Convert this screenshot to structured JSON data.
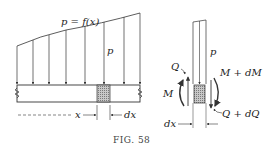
{
  "figure": {
    "caption": "FIG. 58",
    "beam_diagram": {
      "load_label": "p = f(x)",
      "load_arrow_label": "p",
      "position_label": "x",
      "element_width_label": "dx"
    },
    "element_diagram": {
      "load_label": "p",
      "left_shear_label": "Q",
      "left_moment_label": "M",
      "right_moment_label": "M + dM",
      "right_shear_label": "Q + dQ",
      "width_label": "dx"
    },
    "colors": {
      "line": "#333333",
      "hatch": "#9a9a9a",
      "caption": "#444444"
    }
  }
}
